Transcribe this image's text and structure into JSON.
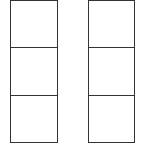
{
  "diagram": {
    "type": "grid-columns",
    "line_color": "#333333",
    "background": "#ffffff",
    "columns": [
      {
        "name": "left-column",
        "x": 10,
        "width": 48,
        "cells": [
          {
            "label": ""
          },
          {
            "label": ""
          },
          {
            "label": ""
          }
        ]
      },
      {
        "name": "right-column",
        "x": 88,
        "width": 47,
        "cells": [
          {
            "label": ""
          },
          {
            "label": ""
          },
          {
            "label": ""
          }
        ]
      }
    ],
    "rows_per_column": 3
  }
}
